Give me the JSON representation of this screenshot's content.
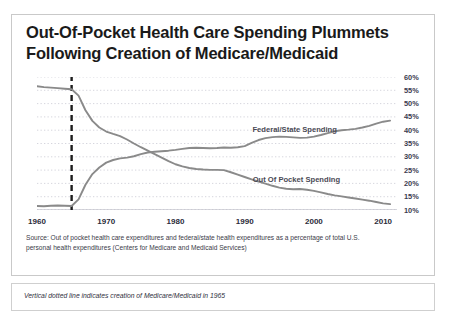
{
  "title": {
    "line1": "Out-Of-Pocket Health Care Spending Plummets",
    "line2": "Following Creation of Medicare/Medicaid"
  },
  "source": {
    "line1": "Source: Out of pocket health care expenditures and federal/state health expenditures as a percentage of total  U.S.",
    "line2": "personal health expenditures (Centers for Medicare and Medicaid Services)"
  },
  "note": "Vertical dotted line indicates creation of Medicare/Medicaid  in 1965",
  "annotation": {
    "marker_year": 1965,
    "marker_style": "dashed-vertical"
  },
  "chart_data": {
    "type": "line",
    "title": "Out-Of-Pocket Health Care Spending Plummets Following Creation of Medicare/Medicaid",
    "xlabel": "",
    "ylabel": "",
    "xlim": [
      1960,
      2012
    ],
    "ylim": [
      10,
      60
    ],
    "ytick_labels": [
      "60%",
      "55%",
      "50%",
      "45%",
      "40%",
      "35%",
      "30%",
      "25%",
      "20%",
      "15%",
      "10%"
    ],
    "ytick_values": [
      60,
      55,
      50,
      45,
      40,
      35,
      30,
      25,
      20,
      15,
      10
    ],
    "xtick_labels": [
      "1960",
      "1970",
      "1980",
      "1990",
      "2000",
      "2010"
    ],
    "xtick_values": [
      1960,
      1970,
      1980,
      1990,
      2000,
      2010
    ],
    "grid": "horizontal-dotted",
    "legend": "inline-labels",
    "series": [
      {
        "name": "Out Of Pocket Spending",
        "color": "#8a8a8a",
        "label_position": "inline-right-of-line",
        "x": [
          1960,
          1961,
          1962,
          1963,
          1964,
          1965,
          1966,
          1967,
          1968,
          1969,
          1970,
          1971,
          1972,
          1973,
          1974,
          1975,
          1976,
          1977,
          1978,
          1979,
          1980,
          1981,
          1982,
          1983,
          1984,
          1985,
          1986,
          1987,
          1988,
          1989,
          1990,
          1991,
          1992,
          1993,
          1994,
          1995,
          1996,
          1997,
          1998,
          1999,
          2000,
          2001,
          2002,
          2003,
          2004,
          2005,
          2006,
          2007,
          2008,
          2009,
          2010,
          2011
        ],
        "values": [
          56.5,
          56.2,
          56.0,
          55.8,
          55.6,
          55.4,
          53.0,
          47.5,
          43.5,
          41.0,
          39.5,
          38.6,
          37.8,
          36.5,
          35.0,
          33.6,
          32.3,
          31.0,
          29.7,
          28.4,
          27.2,
          26.4,
          25.8,
          25.4,
          25.2,
          25.1,
          25.1,
          25.0,
          24.2,
          23.3,
          22.4,
          21.5,
          20.7,
          19.9,
          19.1,
          18.4,
          18.0,
          17.8,
          17.9,
          17.6,
          17.2,
          16.6,
          16.0,
          15.5,
          15.1,
          14.7,
          14.3,
          13.9,
          13.5,
          13.0,
          12.5,
          12.2
        ]
      },
      {
        "name": "Federal/State Spending",
        "color": "#8a8a8a",
        "label_position": "inline-above-line",
        "x": [
          1960,
          1961,
          1962,
          1963,
          1964,
          1965,
          1966,
          1967,
          1968,
          1969,
          1970,
          1971,
          1972,
          1973,
          1974,
          1975,
          1976,
          1977,
          1978,
          1979,
          1980,
          1981,
          1982,
          1983,
          1984,
          1985,
          1986,
          1987,
          1988,
          1989,
          1990,
          1991,
          1992,
          1993,
          1994,
          1995,
          1996,
          1997,
          1998,
          1999,
          2000,
          2001,
          2002,
          2003,
          2004,
          2005,
          2006,
          2007,
          2008,
          2009,
          2010,
          2011
        ],
        "values": [
          11.5,
          11.4,
          11.6,
          11.7,
          11.6,
          11.5,
          14.0,
          19.5,
          23.5,
          26.0,
          27.8,
          28.8,
          29.4,
          29.7,
          30.2,
          31.0,
          31.6,
          31.9,
          32.1,
          32.3,
          32.6,
          33.0,
          33.3,
          33.4,
          33.3,
          33.2,
          33.3,
          33.5,
          33.4,
          33.6,
          34.0,
          35.2,
          36.3,
          37.0,
          37.4,
          37.6,
          37.5,
          37.3,
          37.1,
          37.2,
          37.6,
          38.2,
          38.9,
          39.6,
          40.0,
          40.2,
          40.5,
          41.0,
          41.6,
          42.5,
          43.2,
          43.6
        ]
      }
    ]
  }
}
